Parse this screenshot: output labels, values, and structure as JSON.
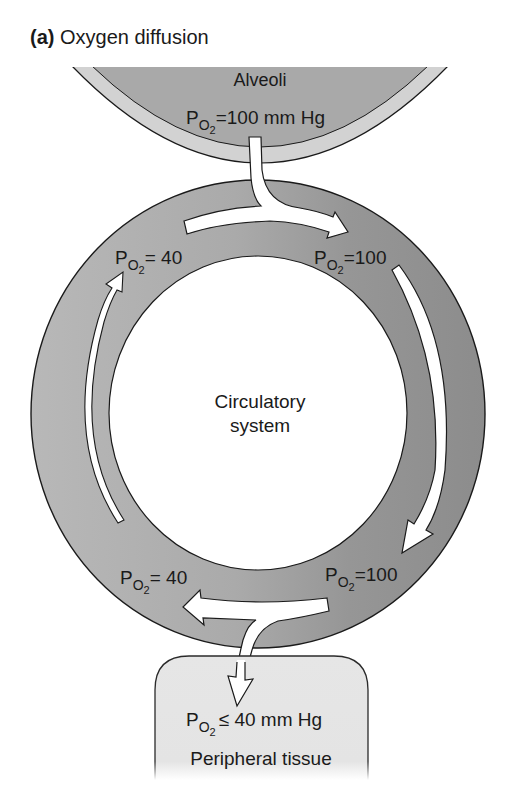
{
  "figure": {
    "panel_letter": "(a)",
    "title": "Oxygen diffusion"
  },
  "alveoli": {
    "label": "Alveoli",
    "po2_prefix": "P",
    "po2_sub": "O",
    "po2_sub2": "2",
    "po2_value": "=100 mm Hg"
  },
  "circulatory": {
    "label_line1": "Circulatory",
    "label_line2": "system",
    "points": [
      {
        "position": "top-left",
        "prefix": "P",
        "sub": "O",
        "sub2": "2",
        "value": "= 40"
      },
      {
        "position": "top-right",
        "prefix": "P",
        "sub": "O",
        "sub2": "2",
        "value": "=100"
      },
      {
        "position": "bottom-left",
        "prefix": "P",
        "sub": "O",
        "sub2": "2",
        "value": "= 40"
      },
      {
        "position": "bottom-right",
        "prefix": "P",
        "sub": "O",
        "sub2": "2",
        "value": "=100"
      }
    ]
  },
  "tissue": {
    "po2_prefix": "P",
    "po2_sub": "O",
    "po2_sub2": "2",
    "po2_value": "≤ 40 mm Hg",
    "label": "Peripheral tissue"
  },
  "colors": {
    "alveoli_outer": "#d2d2d2",
    "alveoli_inner": "#a9a9a9",
    "ring_light": "#b6b6b6",
    "ring_dark": "#909090",
    "tissue_fill": "#e4e4e4",
    "arrow_fill": "#ffffff",
    "stroke": "#1a1a1a"
  }
}
